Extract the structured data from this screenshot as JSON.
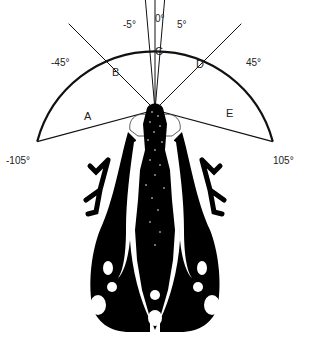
{
  "diagram": {
    "angle_labels": [
      "-105°",
      "-45°",
      "-5°",
      "0°",
      "5°",
      "45°",
      "105°"
    ],
    "sectors": [
      {
        "id": "A",
        "label": "A",
        "from": "-105°",
        "to": "-45°"
      },
      {
        "id": "B",
        "label": "B",
        "from": "-45°",
        "to": "-5°"
      },
      {
        "id": "C",
        "label": "C",
        "from": "-5°",
        "to": "5°"
      },
      {
        "id": "D",
        "label": "D",
        "from": "5°",
        "to": "45°"
      },
      {
        "id": "E",
        "label": "E",
        "from": "45°",
        "to": "105°"
      }
    ],
    "colors": {
      "line": "#111111",
      "body": "#000000",
      "background": "#ffffff"
    }
  }
}
